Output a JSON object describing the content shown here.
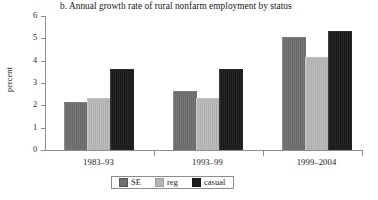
{
  "chart_data": {
    "type": "bar",
    "title": "b. Annual growth rate of rural nonfarm employment by status",
    "xlabel": "",
    "ylabel": "percent",
    "categories": [
      "1983–93",
      "1993–99",
      "1999–2004"
    ],
    "series": [
      {
        "name": "SE",
        "values": [
          2.1,
          2.6,
          5.0
        ],
        "color": "#6e6e6e"
      },
      {
        "name": "reg",
        "values": [
          2.3,
          2.3,
          4.1
        ],
        "color": "#b5b5b5"
      },
      {
        "name": "casual",
        "values": [
          3.6,
          3.6,
          5.3
        ],
        "color": "#1c1c1c"
      }
    ],
    "ylim": [
      0,
      6
    ],
    "yticks": [
      0,
      1,
      2,
      3,
      4,
      5,
      6
    ],
    "ytick_labels": [
      "0",
      "1",
      "2",
      "3",
      "4",
      "5",
      "6"
    ],
    "grid": false,
    "legend_position": "bottom-center"
  },
  "legend": {
    "items": [
      {
        "label": "SE",
        "swatch": "se"
      },
      {
        "label": "reg",
        "swatch": "reg"
      },
      {
        "label": "casual",
        "swatch": "casual"
      }
    ]
  }
}
